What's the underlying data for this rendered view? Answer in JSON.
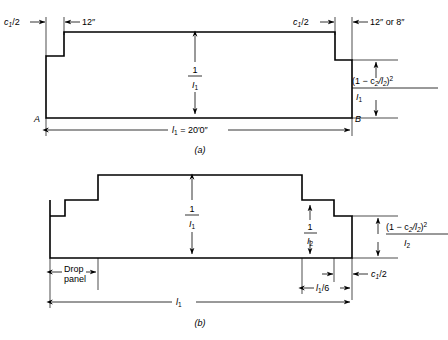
{
  "figure": {
    "background_color": "#ffffff",
    "line_color": "#000000"
  },
  "panel_a": {
    "caption": "(a)",
    "left_column_label": "c",
    "left_column_sub": "1",
    "left_column_text": "/2",
    "left_thickness_label": "12″",
    "right_column_label": "c",
    "right_column_sub": "1",
    "right_column_text": "/2",
    "right_thickness_label": "12″ or 8″",
    "center_fraction": {
      "numerator": "1",
      "denominator_sym": "I",
      "denominator_sub": "1"
    },
    "end_formula": {
      "numerator_pre": "(1 − c",
      "numerator_sub1": "2",
      "numerator_mid": "/l",
      "numerator_sub2": "2",
      "numerator_post": ")",
      "numerator_sup": "2",
      "denominator_sym": "I",
      "denominator_sub": "1"
    },
    "point_left": "A",
    "point_right": "B",
    "span_label_sym": "l",
    "span_label_sub": "1",
    "span_label_value": " = 20′0″"
  },
  "panel_b": {
    "caption": "(b)",
    "drop_panel_label_line1": "Drop",
    "drop_panel_label_line2": "panel",
    "center_fraction": {
      "numerator": "1",
      "denominator_sym": "I",
      "denominator_sub": "1"
    },
    "inner_fraction": {
      "numerator": "1",
      "denominator_sym": "I",
      "denominator_sub": "2"
    },
    "end_formula": {
      "numerator_pre": "(1 − c",
      "numerator_sub1": "2",
      "numerator_mid": "/l",
      "numerator_sub2": "2",
      "numerator_post": ")",
      "numerator_sup": "2",
      "denominator_sym": "I",
      "denominator_sub": "2"
    },
    "sixth_span_label_sym": "l",
    "sixth_span_label_sub": "1",
    "sixth_span_label_text": "/6",
    "column_half_label_sym": "c",
    "column_half_label_sub": "1",
    "column_half_label_text": "/2",
    "span_label_sym": "l",
    "span_label_sub": "1"
  }
}
